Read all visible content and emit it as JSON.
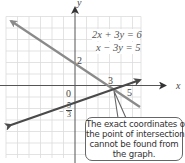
{
  "diagram": {
    "type": "system-of-linear-equations-graph",
    "equations": [
      "2x + 3y = 6",
      "x − 3y = 5"
    ],
    "axis_labels": {
      "x": "x",
      "y": "y"
    },
    "tick_labels": {
      "origin": "0",
      "y_intercept_line1": "2",
      "x_intercept_line1": "3",
      "x_intercept_line2": "5",
      "y_intercept_line2_num": "5",
      "y_intercept_line2_den": "3",
      "y_intercept_line2_sign": "−"
    },
    "callout": {
      "lines": [
        "The exact coordinates of",
        "the point of intersection",
        "cannot be found from",
        "the graph."
      ]
    },
    "colors": {
      "line1": "#8a8a8a",
      "line2": "#4a4a4a",
      "grid": "#dcdcdc",
      "axis": "#555555"
    }
  }
}
